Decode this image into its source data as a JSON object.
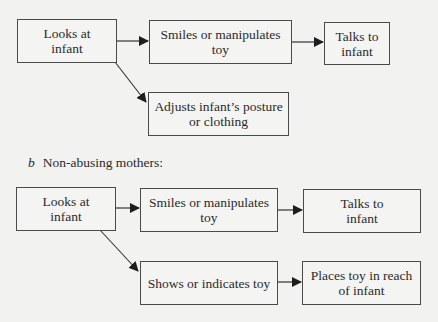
{
  "diagram_a": {
    "nodes": [
      {
        "id": "a1",
        "label": "Looks at infant"
      },
      {
        "id": "a2",
        "label": "Smiles or manipulates toy"
      },
      {
        "id": "a3",
        "label": "Talks to infant"
      },
      {
        "id": "a4",
        "label": "Adjusts infant’s posture or clothing"
      }
    ],
    "edges": [
      {
        "from": "a1",
        "to": "a2"
      },
      {
        "from": "a2",
        "to": "a3"
      },
      {
        "from": "a1",
        "to": "a4"
      }
    ]
  },
  "section_b": {
    "letter": "b",
    "title": "Non-abusing mothers:"
  },
  "diagram_b": {
    "nodes": [
      {
        "id": "b1",
        "label": "Looks at infant"
      },
      {
        "id": "b2",
        "label": "Smiles or manipulates toy"
      },
      {
        "id": "b3",
        "label": "Talks to infant"
      },
      {
        "id": "b4",
        "label": "Shows or indicates toy"
      },
      {
        "id": "b5",
        "label": "Places toy in reach of infant"
      }
    ],
    "edges": [
      {
        "from": "b1",
        "to": "b2"
      },
      {
        "from": "b2",
        "to": "b3"
      },
      {
        "from": "b1",
        "to": "b4"
      },
      {
        "from": "b4",
        "to": "b5"
      }
    ]
  }
}
